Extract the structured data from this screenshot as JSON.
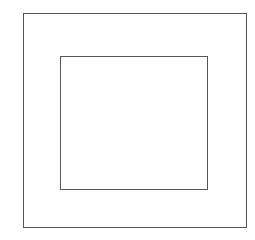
{
  "canvas": {
    "width": 255,
    "height": 230,
    "background": "#ffffff"
  },
  "shapes": [
    {
      "name": "outer-square",
      "x": 23,
      "y": 13,
      "width": 224,
      "height": 215,
      "stroke": "#555555"
    },
    {
      "name": "inner-square",
      "x": 60,
      "y": 56,
      "width": 148,
      "height": 134,
      "stroke": "#555555"
    }
  ]
}
